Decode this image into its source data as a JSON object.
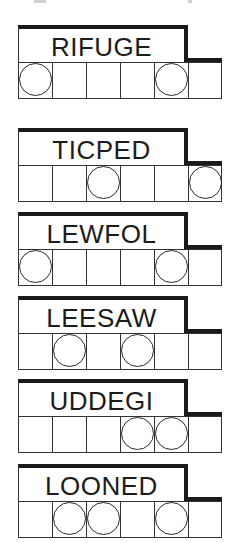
{
  "puzzles": [
    {
      "word": "RIFUGE",
      "circled": [
        true,
        false,
        false,
        false,
        true,
        false
      ]
    },
    {
      "word": "TICPED",
      "circled": [
        false,
        false,
        true,
        false,
        false,
        true
      ]
    },
    {
      "word": "LEWFOL",
      "circled": [
        true,
        false,
        false,
        false,
        true,
        false
      ]
    },
    {
      "word": "LEESAW",
      "circled": [
        false,
        true,
        false,
        true,
        false,
        false
      ]
    },
    {
      "word": "UDDEGI",
      "circled": [
        false,
        false,
        false,
        true,
        true,
        false
      ]
    },
    {
      "word": "LOONED",
      "circled": [
        false,
        true,
        true,
        false,
        true,
        false
      ]
    }
  ],
  "colors": {
    "ink": "#1c1c1c",
    "background": "#ffffff"
  }
}
